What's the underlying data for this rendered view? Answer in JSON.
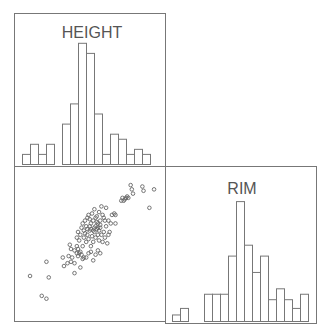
{
  "chart_data": [
    {
      "type": "bar",
      "title": "HEIGHT",
      "panel": "top-left (diagonal 1,1)",
      "bins": 19,
      "values": [
        1,
        2,
        1,
        2,
        0,
        4,
        6,
        12,
        11,
        5,
        1,
        3,
        2.5,
        1,
        1.5,
        1,
        0,
        0,
        0
      ],
      "xlabel": "",
      "ylabel": "",
      "grid": false
    },
    {
      "type": "bar",
      "title": "RIM",
      "panel": "bottom-right (diagonal 2,2)",
      "bins": 18,
      "values": [
        0.6,
        1.2,
        0,
        0,
        2.5,
        2.5,
        2.5,
        6,
        11,
        7,
        4.5,
        6,
        2,
        3,
        2,
        1.2,
        2.5,
        0
      ],
      "xlabel": "",
      "ylabel": "",
      "grid": false
    },
    {
      "type": "scatter",
      "title": "",
      "panel": "bottom-left (2,1)",
      "xlabel": "HEIGHT",
      "ylabel": "RIM",
      "note": "Unitless pixel-space positions (0-100) within panel; strong positive correlation",
      "points": [
        [
          12,
          31
        ],
        [
          22,
          17
        ],
        [
          26,
          15
        ],
        [
          28,
          30
        ],
        [
          26,
          41
        ],
        [
          41,
          38
        ],
        [
          40,
          44
        ],
        [
          45,
          45
        ],
        [
          47,
          41
        ],
        [
          50,
          49
        ],
        [
          52,
          47
        ],
        [
          53,
          50
        ],
        [
          55,
          48
        ],
        [
          56,
          46
        ],
        [
          57,
          52
        ],
        [
          58,
          44
        ],
        [
          54,
          56
        ],
        [
          55,
          60
        ],
        [
          58,
          58
        ],
        [
          60,
          55
        ],
        [
          61,
          60
        ],
        [
          62,
          57
        ],
        [
          63,
          63
        ],
        [
          64,
          52
        ],
        [
          65,
          59
        ],
        [
          66,
          55
        ],
        [
          67,
          62
        ],
        [
          68,
          58
        ],
        [
          69,
          64
        ],
        [
          70,
          60
        ],
        [
          71,
          56
        ],
        [
          72,
          65
        ],
        [
          73,
          60
        ],
        [
          74,
          55
        ],
        [
          75,
          62
        ],
        [
          76,
          58
        ],
        [
          77,
          66
        ],
        [
          78,
          54
        ],
        [
          79,
          60
        ],
        [
          80,
          62
        ],
        [
          63,
          71
        ],
        [
          65,
          75
        ],
        [
          67,
          78
        ],
        [
          69,
          73
        ],
        [
          71,
          76
        ],
        [
          73,
          80
        ],
        [
          75,
          72
        ],
        [
          77,
          79
        ],
        [
          79,
          70
        ],
        [
          81,
          68
        ],
        [
          52,
          58
        ],
        [
          53,
          62
        ],
        [
          56,
          65
        ],
        [
          57,
          68
        ],
        [
          59,
          70
        ],
        [
          60,
          66
        ],
        [
          61,
          72
        ],
        [
          62,
          74
        ],
        [
          64,
          68
        ],
        [
          66,
          70
        ],
        [
          68,
          72
        ],
        [
          70,
          68
        ],
        [
          72,
          70
        ],
        [
          74,
          74
        ],
        [
          76,
          70
        ],
        [
          58,
          63
        ],
        [
          59,
          61
        ],
        [
          61,
          64
        ],
        [
          63,
          66
        ],
        [
          64,
          64
        ],
        [
          66,
          63
        ],
        [
          67,
          65
        ],
        [
          68,
          66
        ],
        [
          69,
          69
        ],
        [
          70,
          65
        ],
        [
          71,
          63
        ],
        [
          72,
          67
        ],
        [
          82,
          74
        ],
        [
          84,
          75
        ],
        [
          85,
          74
        ],
        [
          90,
          84
        ],
        [
          91,
          86
        ],
        [
          92,
          84
        ],
        [
          93,
          85
        ],
        [
          94,
          86
        ],
        [
          95,
          87
        ],
        [
          96,
          86
        ],
        [
          100,
          89
        ],
        [
          98,
          95
        ],
        [
          99,
          92
        ],
        [
          108,
          94
        ],
        [
          109,
          91
        ],
        [
          118,
          92
        ],
        [
          114,
          79
        ],
        [
          85,
          68
        ],
        [
          50,
          33
        ],
        [
          44,
          40
        ],
        [
          55,
          37
        ],
        [
          50,
          40
        ],
        [
          48,
          44
        ],
        [
          47,
          50
        ],
        [
          46,
          53
        ],
        [
          52,
          52
        ],
        [
          53,
          45
        ],
        [
          54,
          47
        ],
        [
          57,
          43
        ],
        [
          60,
          44
        ],
        [
          62,
          47
        ],
        [
          64,
          48
        ],
        [
          66,
          42
        ],
        [
          68,
          46
        ],
        [
          70,
          49
        ],
        [
          72,
          47
        ]
      ]
    }
  ],
  "labels": {
    "height_label": "HEIGHT",
    "rim_label": "RIM"
  }
}
